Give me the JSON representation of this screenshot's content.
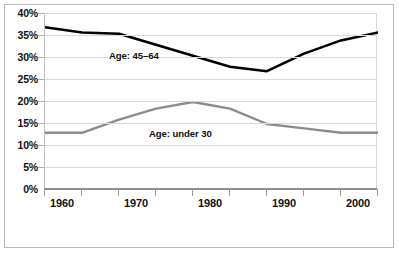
{
  "chart_data": {
    "type": "line",
    "title": "",
    "subtitle": "",
    "xlabel": "",
    "ylabel": "",
    "x": [
      1960,
      1965,
      1970,
      1975,
      1980,
      1985,
      1990,
      1995,
      2000,
      2005
    ],
    "xlim": [
      1960,
      2005
    ],
    "ylim": [
      0,
      40
    ],
    "grid": true,
    "grid_axis": "y",
    "legend_position": "inline-annotation",
    "y_tick_labels": [
      "0%",
      "5%",
      "10%",
      "15%",
      "20%",
      "25%",
      "30%",
      "35%",
      "40%"
    ],
    "y_tick_values": [
      0,
      5,
      10,
      15,
      20,
      25,
      30,
      35,
      40
    ],
    "x_tick_labels": [
      "1960",
      "1970",
      "1980",
      "1990",
      "2000"
    ],
    "x_tick_values": [
      1960,
      1970,
      1980,
      1990,
      2000
    ],
    "x_minor_tick_values": [
      1960,
      1965,
      1970,
      1975,
      1980,
      1985,
      1990,
      1995,
      2000,
      2005
    ],
    "series": [
      {
        "name": "Age: 45–64",
        "color": "#000000",
        "line_width": 2.6,
        "values": [
          37.0,
          35.8,
          35.5,
          33.0,
          30.5,
          28.0,
          27.0,
          31.0,
          34.0,
          35.8
        ]
      },
      {
        "name": "Age: under 30",
        "color": "#8c8c8c",
        "line_width": 2.4,
        "values": [
          13.0,
          13.0,
          16.0,
          18.5,
          20.0,
          18.5,
          15.0,
          14.0,
          13.0,
          13.0
        ]
      }
    ],
    "annotations": [
      {
        "text": "Age: 45–64",
        "series": 0
      },
      {
        "text": "Age: under 30",
        "series": 1
      }
    ]
  },
  "axis": {
    "y_labels": [
      "40%",
      "35%",
      "30%",
      "25%",
      "20%",
      "15%",
      "10%",
      "5%",
      "0%"
    ],
    "x_labels": [
      "1960",
      "1970",
      "1980",
      "1990",
      "2000"
    ]
  },
  "colors": {
    "series_older": "#000000",
    "series_younger": "#8c8c8c",
    "gridline": "#d8d8d8",
    "frame": "#b9b9b9",
    "text": "#111111",
    "background": "#ffffff"
  }
}
